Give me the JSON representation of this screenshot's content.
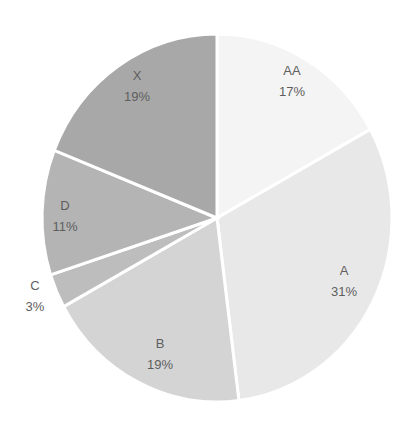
{
  "chart_data": {
    "type": "pie",
    "title": "",
    "categories": [
      "AA",
      "A",
      "B",
      "C",
      "D",
      "X"
    ],
    "values": [
      17,
      31,
      19,
      3,
      11,
      19
    ],
    "value_format": "percent",
    "start_angle": "12 o'clock",
    "direction": "clockwise",
    "colors": [
      "#f4f4f4",
      "#e8e8e8",
      "#d4d4d4",
      "#bdbdbd",
      "#b4b4b4",
      "#a8a8a8"
    ],
    "legend": "none",
    "data_labels": [
      {
        "name": "AA",
        "pct": "17%",
        "x": 292,
        "y": 75,
        "outside": false
      },
      {
        "name": "A",
        "pct": "31%",
        "x": 344,
        "y": 275,
        "outside": false
      },
      {
        "name": "B",
        "pct": "19%",
        "x": 160,
        "y": 348,
        "outside": false
      },
      {
        "name": "C",
        "pct": "3%",
        "x": 35,
        "y": 290,
        "outside": true
      },
      {
        "name": "D",
        "pct": "11%",
        "x": 65,
        "y": 210,
        "outside": false
      },
      {
        "name": "X",
        "pct": "19%",
        "x": 137,
        "y": 80,
        "outside": false
      }
    ]
  },
  "geometry": {
    "cx": 217,
    "cy": 218,
    "rx": 175,
    "ry": 184
  }
}
